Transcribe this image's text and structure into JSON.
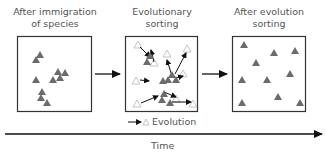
{
  "panels": [
    {
      "title_line1": "After immigration",
      "title_line2": "of species"
    },
    {
      "title_line1": "Evolutionary",
      "title_line2": "sorting"
    },
    {
      "title_line1": "After evolution",
      "title_line2": "sorting"
    }
  ],
  "legend": {
    "label": "Evolution"
  },
  "axis": {
    "label": "Time"
  },
  "colors": {
    "filled": "#6b6b6b",
    "hollow": "#c8c8c8",
    "line": "#222222"
  },
  "panel1_triangles": [
    [
      40,
      55
    ],
    [
      36,
      59
    ],
    [
      58,
      72
    ],
    [
      65,
      72
    ],
    [
      36,
      79
    ],
    [
      53,
      79
    ],
    [
      60,
      78
    ],
    [
      42,
      91
    ],
    [
      41,
      97
    ],
    [
      47,
      102
    ]
  ],
  "panel2_filled": [
    [
      150,
      55
    ],
    [
      148,
      60
    ],
    [
      179,
      73
    ],
    [
      177,
      79
    ],
    [
      172,
      80
    ],
    [
      157,
      79
    ],
    [
      164,
      93
    ],
    [
      162,
      98
    ],
    [
      170,
      102
    ]
  ],
  "panel3_triangles": [
    [
      244,
      44
    ],
    [
      274,
      52
    ],
    [
      295,
      50
    ],
    [
      256,
      62
    ],
    [
      242,
      79
    ],
    [
      267,
      79
    ],
    [
      290,
      73
    ],
    [
      278,
      96
    ],
    [
      242,
      102
    ],
    [
      300,
      102
    ]
  ]
}
